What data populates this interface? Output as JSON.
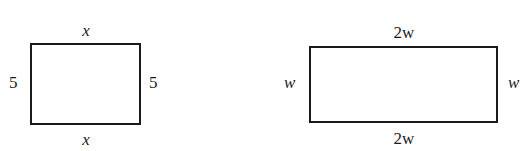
{
  "figures": [
    {
      "name": "rectangle-1",
      "top_label": "x",
      "bottom_label": "x",
      "left_label": "5",
      "right_label": "5"
    },
    {
      "name": "rectangle-2",
      "top_label_coef": "2",
      "top_label_var": "w",
      "bottom_label_coef": "2",
      "bottom_label_var": "w",
      "left_label": "w",
      "right_label": "w"
    }
  ]
}
